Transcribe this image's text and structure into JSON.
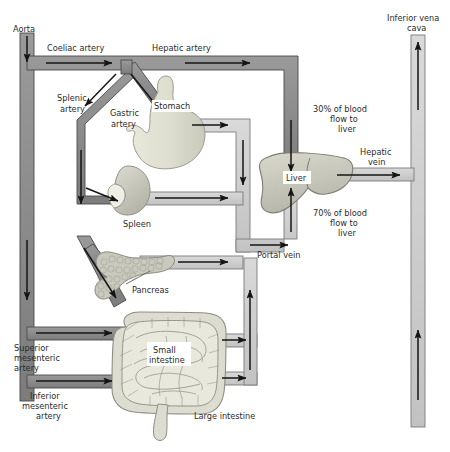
{
  "figure": {
    "type": "anatomical-flow-diagram",
    "background": "#ffffff"
  },
  "colors": {
    "artery_fill": "#8c8c8c",
    "artery_stroke": "#3f3f3f",
    "vein_fill": "#cfcfcf",
    "vein_stroke": "#6f6f6f",
    "organ_light": "#ececdf",
    "organ_mid": "#d6d6cc",
    "organ_dark": "#b9b9ae",
    "arrow": "#151515",
    "text": "#2b2b2b"
  },
  "labels": {
    "aorta": "Aorta",
    "coeliac_artery": "Coeliac artery",
    "hepatic_artery": "Hepatic artery",
    "splenic_artery": "Splenic\nartery",
    "splenic_artery_l1": "Splenic",
    "splenic_artery_l2": "artery",
    "gastric_artery_l1": "Gastric",
    "gastric_artery_l2": "artery",
    "stomach": "Stomach",
    "spleen": "Spleen",
    "pancreas": "Pancreas",
    "small_intestine_l1": "Small",
    "small_intestine_l2": "intestine",
    "large_intestine": "Large intestine",
    "superior_mesenteric_l1": "Superior",
    "superior_mesenteric_l2": "mesenteric",
    "superior_mesenteric_l3": "artery",
    "inferior_mesenteric_l1": "Inferior",
    "inferior_mesenteric_l2": "mesenteric",
    "inferior_mesenteric_l3": "artery",
    "portal_vein": "Portal vein",
    "liver": "Liver",
    "hepatic_vein_l1": "Hepatic",
    "hepatic_vein_l2": "vein",
    "inferior_vena_cava_l1": "Inferior vena",
    "inferior_vena_cava_l2": "cava",
    "flow_30_l1": "30% of blood",
    "flow_30_l2": "flow to",
    "flow_30_l3": "liver",
    "flow_70_l1": "70% of blood",
    "flow_70_l2": "flow to",
    "flow_70_l3": "liver"
  },
  "flow_values": {
    "arterial_supply_to_liver_percent": 30,
    "portal_supply_to_liver_percent": 70
  },
  "vessels": [
    {
      "name": "aorta",
      "kind": "artery",
      "direction": "down"
    },
    {
      "name": "coeliac-artery",
      "kind": "artery",
      "direction": "right"
    },
    {
      "name": "hepatic-artery",
      "kind": "artery",
      "direction": "right-then-down"
    },
    {
      "name": "splenic-artery",
      "kind": "artery",
      "direction": "down-left"
    },
    {
      "name": "gastric-artery",
      "kind": "artery",
      "direction": "down-right"
    },
    {
      "name": "superior-mesenteric-artery",
      "kind": "artery",
      "direction": "right"
    },
    {
      "name": "inferior-mesenteric-artery",
      "kind": "artery",
      "direction": "right"
    },
    {
      "name": "gastric-vein",
      "kind": "vein",
      "direction": "right-then-down"
    },
    {
      "name": "splenic-vein",
      "kind": "vein",
      "direction": "right"
    },
    {
      "name": "pancreatic-vein",
      "kind": "vein",
      "direction": "right"
    },
    {
      "name": "superior-mesenteric-vein",
      "kind": "vein",
      "direction": "right-then-up"
    },
    {
      "name": "inferior-mesenteric-vein",
      "kind": "vein",
      "direction": "right-then-up"
    },
    {
      "name": "portal-vein",
      "kind": "vein",
      "direction": "right-then-up"
    },
    {
      "name": "hepatic-vein",
      "kind": "vein",
      "direction": "right"
    },
    {
      "name": "inferior-vena-cava",
      "kind": "vein",
      "direction": "up"
    }
  ],
  "organs": [
    {
      "name": "stomach"
    },
    {
      "name": "spleen"
    },
    {
      "name": "pancreas"
    },
    {
      "name": "small-intestine"
    },
    {
      "name": "large-intestine"
    },
    {
      "name": "liver"
    }
  ]
}
